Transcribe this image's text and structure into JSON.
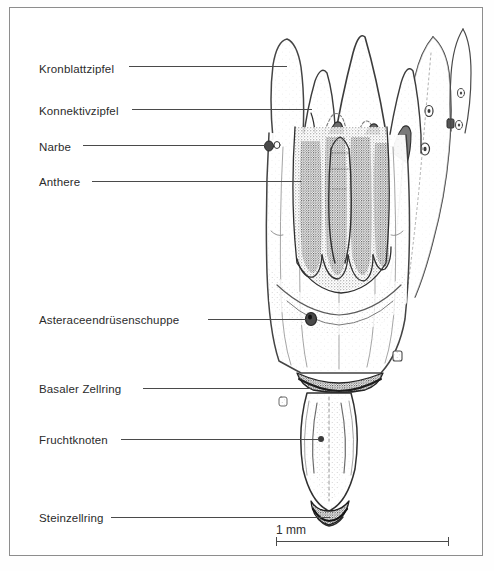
{
  "figure": {
    "kind": "botanical-line-drawing",
    "language": "de",
    "background_color": "#ffffff",
    "frame_color": "#8d8d8d",
    "ink_color": "#3a3a3a"
  },
  "labels": [
    {
      "id": "kronblattzipfel",
      "text": "Kronblattzipfel",
      "x": 38,
      "y": 63,
      "leader_x1": 128,
      "leader_x2": 286,
      "leader_y": 65
    },
    {
      "id": "konnektivzipfel",
      "text": "Konnektivzipfel",
      "x": 38,
      "y": 105,
      "leader_x1": 131,
      "leader_x2": 311,
      "leader_y": 108
    },
    {
      "id": "narbe",
      "text": "Narbe",
      "x": 38,
      "y": 141,
      "leader_x1": 82,
      "leader_x2": 272,
      "leader_y": 144
    },
    {
      "id": "anthere",
      "text": "Anthere",
      "x": 38,
      "y": 176,
      "leader_x1": 91,
      "leader_x2": 300,
      "leader_y": 180
    },
    {
      "id": "asteraceendruesenschuppe",
      "text": "Asteraceendrüsenschuppe",
      "x": 38,
      "y": 314,
      "leader_x1": 207,
      "leader_x2": 306,
      "leader_y": 318
    },
    {
      "id": "basaler-zellring",
      "text": "Basaler Zellring",
      "x": 38,
      "y": 383,
      "leader_x1": 142,
      "leader_x2": 311,
      "leader_y": 387
    },
    {
      "id": "fruchtknoten",
      "text": "Fruchtknoten",
      "x": 38,
      "y": 434,
      "leader_x1": 120,
      "leader_x2": 318,
      "leader_y": 438
    },
    {
      "id": "steinzellring",
      "text": "Steinzellring",
      "x": 38,
      "y": 512,
      "leader_x1": 110,
      "leader_x2": 329,
      "leader_y": 516
    }
  ],
  "scale_bar": {
    "caption": "1 mm",
    "x_start": 275,
    "x_end": 448,
    "y": 540,
    "caption_x": 340,
    "caption_y": 523,
    "tick_height": 9
  }
}
